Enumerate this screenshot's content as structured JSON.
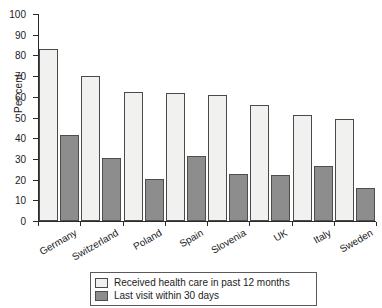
{
  "chart_data": {
    "type": "bar",
    "title": "",
    "subtitle": "",
    "xlabel": "",
    "ylabel": "Per cent",
    "ylim": [
      0,
      100
    ],
    "ytick_step": 10,
    "yticks": [
      0,
      10,
      20,
      30,
      40,
      50,
      60,
      70,
      80,
      90,
      100
    ],
    "grid": false,
    "legend_position": "bottom-center",
    "categories": [
      "Germany",
      "Switzerland",
      "Poland",
      "Spain",
      "Slovenia",
      "UK",
      "Italy",
      "Sweden"
    ],
    "series": [
      {
        "name": "Received health care in past 12 months",
        "color": "#f1f1ef",
        "values": [
          83,
          70,
          62.5,
          62,
          61,
          56,
          51,
          49.5
        ]
      },
      {
        "name": "Last visit within 30 days",
        "color": "#8d8d8d",
        "values": [
          41.5,
          30.5,
          20.5,
          31.5,
          22.5,
          22,
          26.5,
          16
        ]
      }
    ]
  },
  "legend": {
    "items": [
      {
        "label": "Received health care in past 12 months",
        "swatch": "light"
      },
      {
        "label": "Last visit within 30 days",
        "swatch": "dark"
      }
    ]
  },
  "colors": {
    "light_bar": "#f1f1ef",
    "dark_bar": "#8d8d8d",
    "axis": "#2b2b2b",
    "text": "#1c1c1c",
    "background": "#ffffff"
  }
}
